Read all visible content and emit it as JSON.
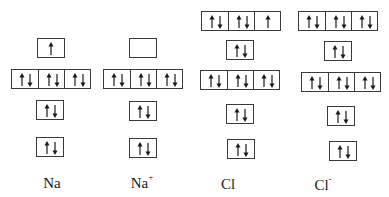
{
  "diagram": {
    "type": "orbital box diagram",
    "species": [
      {
        "id": "na",
        "label": "Na",
        "charge": "",
        "orbitals": [
          {
            "name": "1s",
            "boxes": [
              "updown"
            ]
          },
          {
            "name": "2s",
            "boxes": [
              "updown"
            ]
          },
          {
            "name": "2p",
            "boxes": [
              "updown",
              "updown",
              "updown"
            ]
          },
          {
            "name": "3s",
            "boxes": [
              "up"
            ]
          }
        ]
      },
      {
        "id": "na-plus",
        "label": "Na",
        "charge": "+",
        "orbitals": [
          {
            "name": "1s",
            "boxes": [
              "updown"
            ]
          },
          {
            "name": "2s",
            "boxes": [
              "updown"
            ]
          },
          {
            "name": "2p",
            "boxes": [
              "updown",
              "updown",
              "updown"
            ]
          },
          {
            "name": "3s",
            "boxes": [
              "empty"
            ]
          }
        ]
      },
      {
        "id": "cl",
        "label": "Cl",
        "charge": "",
        "orbitals": [
          {
            "name": "1s",
            "boxes": [
              "updown"
            ]
          },
          {
            "name": "2s",
            "boxes": [
              "updown"
            ]
          },
          {
            "name": "2p",
            "boxes": [
              "updown",
              "updown",
              "updown"
            ]
          },
          {
            "name": "3s",
            "boxes": [
              "updown"
            ]
          },
          {
            "name": "3p",
            "boxes": [
              "updown",
              "updown",
              "up"
            ]
          }
        ]
      },
      {
        "id": "cl-minus",
        "label": "Cl",
        "charge": "-",
        "orbitals": [
          {
            "name": "1s",
            "boxes": [
              "updown"
            ]
          },
          {
            "name": "2s",
            "boxes": [
              "updown"
            ]
          },
          {
            "name": "2p",
            "boxes": [
              "updown",
              "updown",
              "updown"
            ]
          },
          {
            "name": "3s",
            "boxes": [
              "updown"
            ]
          },
          {
            "name": "3p",
            "boxes": [
              "updown",
              "updown",
              "updown"
            ]
          }
        ]
      }
    ]
  },
  "labels": {
    "na": {
      "base": "Na",
      "sup": ""
    },
    "na_plus": {
      "base": "Na",
      "sup": "+"
    },
    "cl": {
      "base": "Cl",
      "sup": ""
    },
    "cl_minus": {
      "base": "Cl",
      "sup": "-"
    }
  },
  "colors": {
    "line": "#3a3a3a",
    "arrow": "#1a1a1a",
    "background": "#ffffff"
  }
}
